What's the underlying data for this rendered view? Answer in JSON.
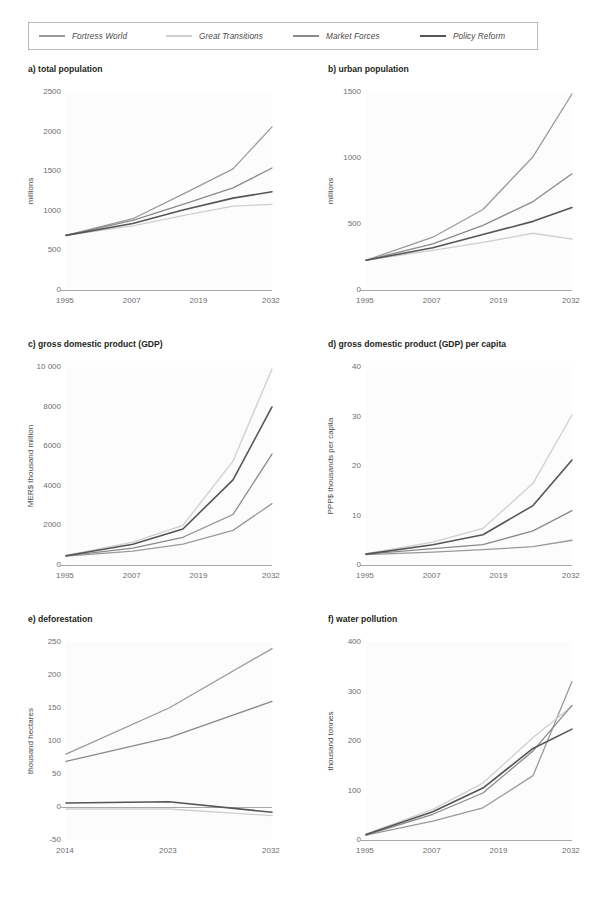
{
  "legend": {
    "items": [
      {
        "label": "Fortress World",
        "color": "#9a9a9a"
      },
      {
        "label": "Great Transitions",
        "color": "#cfcfcf"
      },
      {
        "label": "Market Forces",
        "color": "#8a8a8a"
      },
      {
        "label": "Policy Reform",
        "color": "#555555"
      }
    ]
  },
  "chart_data": [
    {
      "id": "a",
      "type": "line",
      "title": "a) total population",
      "xlabel": "",
      "ylabel": "millions",
      "x": [
        1995,
        2007,
        2016,
        2025,
        2032
      ],
      "xticks": [
        "1995",
        "2007",
        "2019",
        "2032"
      ],
      "xtick_values": [
        1995,
        2007,
        2019,
        2032
      ],
      "xlim": [
        1995,
        2032
      ],
      "ylim": [
        0,
        2500
      ],
      "yticks": [
        "0",
        "500",
        "1000",
        "1500",
        "2000",
        "2500"
      ],
      "ytick_values": [
        0,
        500,
        1000,
        1500,
        2000,
        2500
      ],
      "grid": false,
      "legend_position": "top",
      "series": [
        {
          "name": "Fortress World",
          "values": [
            690,
            900,
            1210,
            1530,
            2060
          ]
        },
        {
          "name": "Great Transitions",
          "values": [
            690,
            810,
            940,
            1060,
            1080
          ]
        },
        {
          "name": "Market Forces",
          "values": [
            690,
            880,
            1080,
            1290,
            1540
          ]
        },
        {
          "name": "Policy Reform",
          "values": [
            690,
            840,
            1010,
            1160,
            1240
          ]
        }
      ]
    },
    {
      "id": "b",
      "type": "line",
      "title": "b) urban population",
      "xlabel": "",
      "ylabel": "millions",
      "x": [
        1995,
        2007,
        2016,
        2025,
        2032
      ],
      "xticks": [
        "1995",
        "2007",
        "2019",
        "2032"
      ],
      "xtick_values": [
        1995,
        2007,
        2019,
        2032
      ],
      "xlim": [
        1995,
        2032
      ],
      "ylim": [
        0,
        1500
      ],
      "yticks": [
        "0",
        "500",
        "1000",
        "1500"
      ],
      "ytick_values": [
        0,
        500,
        1000,
        1500
      ],
      "grid": false,
      "legend_position": "top",
      "series": [
        {
          "name": "Fortress World",
          "values": [
            225,
            400,
            610,
            1010,
            1485
          ]
        },
        {
          "name": "Great Transitions",
          "values": [
            225,
            300,
            360,
            430,
            385
          ]
        },
        {
          "name": "Market Forces",
          "values": [
            225,
            350,
            490,
            670,
            880
          ]
        },
        {
          "name": "Policy Reform",
          "values": [
            225,
            320,
            420,
            520,
            625
          ]
        }
      ]
    },
    {
      "id": "c",
      "type": "line",
      "title": "c) gross domestic product (GDP)",
      "xlabel": "",
      "ylabel": "MER$ thousand million",
      "x": [
        1995,
        2007,
        2016,
        2025,
        2032
      ],
      "xticks": [
        "1995",
        "2007",
        "2019",
        "2032"
      ],
      "xtick_values": [
        1995,
        2007,
        2019,
        2032
      ],
      "xlim": [
        1995,
        2032
      ],
      "ylim": [
        0,
        10000
      ],
      "yticks": [
        "0",
        "2000",
        "4000",
        "6000",
        "8000",
        "10 000"
      ],
      "ytick_values": [
        0,
        2000,
        4000,
        6000,
        8000,
        10000
      ],
      "grid": false,
      "legend_position": "top",
      "series": [
        {
          "name": "Fortress World",
          "values": [
            450,
            700,
            1050,
            1750,
            3100
          ]
        },
        {
          "name": "Great Transitions",
          "values": [
            480,
            1150,
            2000,
            5250,
            9900
          ]
        },
        {
          "name": "Market Forces",
          "values": [
            460,
            850,
            1400,
            2550,
            5600
          ]
        },
        {
          "name": "Policy Reform",
          "values": [
            470,
            1050,
            1820,
            4300,
            7980
          ]
        }
      ]
    },
    {
      "id": "d",
      "type": "line",
      "title": "d) gross domestic product (GDP) per capita",
      "xlabel": "",
      "ylabel": "PPP$ thousands per capita",
      "x": [
        1995,
        2007,
        2016,
        2025,
        2032
      ],
      "xticks": [
        "1995",
        "2007",
        "2019",
        "2032"
      ],
      "xtick_values": [
        1995,
        2007,
        2019,
        2032
      ],
      "xlim": [
        1995,
        2032
      ],
      "ylim": [
        0,
        40
      ],
      "yticks": [
        "0",
        "10",
        "20",
        "30",
        "40"
      ],
      "ytick_values": [
        0,
        10,
        20,
        30,
        40
      ],
      "grid": false,
      "legend_position": "top",
      "series": [
        {
          "name": "Fortress World",
          "values": [
            2.1,
            2.6,
            3.1,
            3.7,
            5.0
          ]
        },
        {
          "name": "Great Transitions",
          "values": [
            2.3,
            4.6,
            7.4,
            16.5,
            30.3
          ]
        },
        {
          "name": "Market Forces",
          "values": [
            2.2,
            3.3,
            4.1,
            6.9,
            11.0
          ]
        },
        {
          "name": "Policy Reform",
          "values": [
            2.2,
            4.1,
            6.1,
            12.0,
            21.2
          ]
        }
      ]
    },
    {
      "id": "e",
      "type": "line",
      "title": "e) deforestation",
      "xlabel": "",
      "ylabel": "thousand hectares",
      "x": [
        2014,
        2023,
        2032
      ],
      "xticks": [
        "2014",
        "2023",
        "2032"
      ],
      "xtick_values": [
        2014,
        2023,
        2032
      ],
      "xlim": [
        2014,
        2032
      ],
      "ylim": [
        -50,
        250
      ],
      "yticks": [
        "-50",
        "0",
        "50",
        "100",
        "150",
        "200",
        "250"
      ],
      "ytick_values": [
        -50,
        0,
        50,
        100,
        150,
        200,
        250
      ],
      "grid": false,
      "legend_position": "top",
      "series": [
        {
          "name": "Fortress World",
          "values": [
            80,
            150,
            240
          ]
        },
        {
          "name": "Great Transitions",
          "values": [
            -3,
            -3,
            -13
          ]
        },
        {
          "name": "Market Forces",
          "values": [
            69,
            105,
            160
          ]
        },
        {
          "name": "Policy Reform",
          "values": [
            6,
            8,
            -8
          ]
        }
      ]
    },
    {
      "id": "f",
      "type": "line",
      "title": "f) water pollution",
      "xlabel": "",
      "ylabel": "thousand tonnes",
      "x": [
        1995,
        2007,
        2016,
        2025,
        2032
      ],
      "xticks": [
        "1995",
        "2007",
        "2019",
        "2032"
      ],
      "xtick_values": [
        1995,
        2007,
        2019,
        2032
      ],
      "xlim": [
        1995,
        2032
      ],
      "ylim": [
        0,
        400
      ],
      "yticks": [
        "0",
        "100",
        "200",
        "300",
        "400"
      ],
      "ytick_values": [
        0,
        100,
        200,
        300,
        400
      ],
      "grid": false,
      "legend_position": "top",
      "series": [
        {
          "name": "Fortress World",
          "values": [
            10,
            38,
            65,
            130,
            320
          ]
        },
        {
          "name": "Great Transitions",
          "values": [
            12,
            62,
            115,
            207,
            270
          ]
        },
        {
          "name": "Market Forces",
          "values": [
            10,
            52,
            95,
            180,
            272
          ]
        },
        {
          "name": "Policy Reform",
          "values": [
            11,
            57,
            105,
            185,
            224
          ]
        }
      ]
    }
  ]
}
